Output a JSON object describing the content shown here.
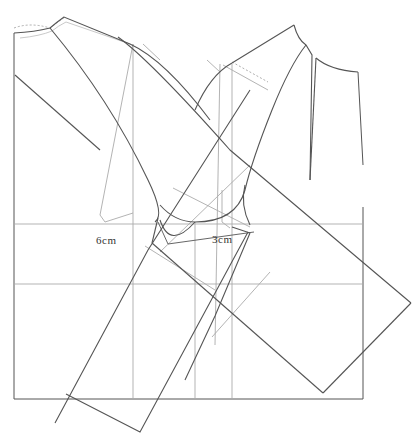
{
  "diagram": {
    "type": "sewing-pattern-draft",
    "labels": {
      "back_armhole_measure": "6cm",
      "front_armhole_measure": "3cm"
    },
    "colors": {
      "outline": "#555555",
      "guide": "#aaaaaa",
      "dashed": "#999999",
      "background": "#ffffff"
    }
  }
}
